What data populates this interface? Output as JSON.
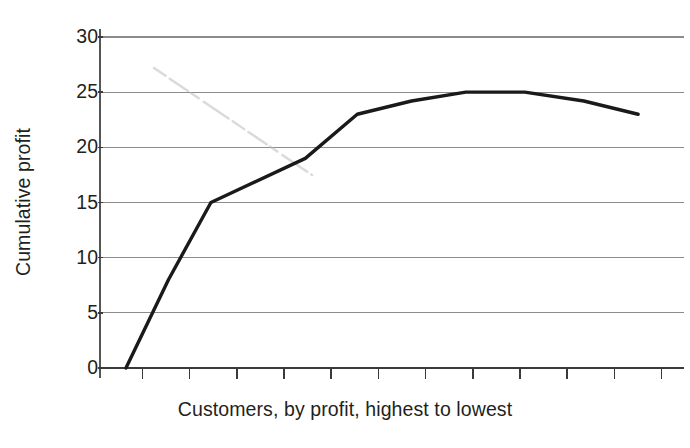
{
  "chart_data": {
    "type": "line",
    "title": "",
    "subtitle": "",
    "xlabel": "Customers, by profit, highest to lowest",
    "ylabel": "Cumulative profit",
    "ylim": [
      0,
      30
    ],
    "ytick_labels": [
      "0",
      "5",
      "10",
      "15",
      "20",
      "25",
      "30"
    ],
    "ytick_values": [
      0,
      5,
      10,
      15,
      20,
      25,
      30
    ],
    "xtick_labels": [],
    "xtick_count": 12,
    "grid": "horizontal",
    "legend": "none",
    "series": [
      {
        "name": "Cumulative profit",
        "color": "#1a1a1a",
        "x": [
          0.55,
          1.45,
          2.35,
          4.35,
          5.45,
          6.6,
          7.75,
          9.0,
          10.25,
          11.4
        ],
        "values": [
          0,
          8,
          15,
          19,
          23,
          24.2,
          25,
          25,
          24.2,
          23
        ]
      }
    ],
    "annotations": [
      {
        "kind": "scan-artifact",
        "description": "faint gray diagonal smudge crossing upper-left plot area"
      }
    ],
    "axis_color": "#231f20",
    "grid_color": "#8c8c8c",
    "background": "#ffffff"
  },
  "axes": {
    "y_title": "Cumulative profit",
    "x_title": "Customers, by profit, highest to lowest"
  }
}
